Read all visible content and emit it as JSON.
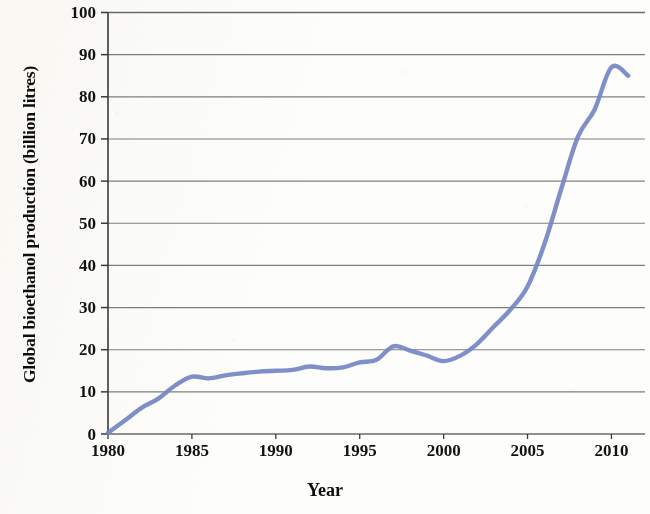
{
  "chart_data": {
    "type": "line",
    "title": "",
    "xlabel": "Year",
    "ylabel": "Global bioethanol production (billion litres)",
    "xlim": [
      1980,
      2012
    ],
    "ylim": [
      0,
      100
    ],
    "xticks": [
      "1980",
      "1985",
      "1990",
      "1995",
      "2000",
      "2005",
      "2010"
    ],
    "xtick_values": [
      1980,
      1985,
      1990,
      1995,
      2000,
      2005,
      2010
    ],
    "yticks": [
      "0",
      "10",
      "20",
      "30",
      "40",
      "50",
      "60",
      "70",
      "80",
      "90",
      "100"
    ],
    "ytick_values": [
      0,
      10,
      20,
      30,
      40,
      50,
      60,
      70,
      80,
      90,
      100
    ],
    "grid": "horizontal",
    "legend": "none",
    "series": [
      {
        "name": "Global bioethanol production",
        "color": "#7485c4",
        "x": [
          1980,
          1981,
          1982,
          1983,
          1984,
          1985,
          1986,
          1987,
          1988,
          1989,
          1990,
          1991,
          1992,
          1993,
          1994,
          1995,
          1996,
          1997,
          1998,
          1999,
          2000,
          2001,
          2002,
          2003,
          2004,
          2005,
          2006,
          2007,
          2008,
          2009,
          2010,
          2011
        ],
        "values": [
          0.3,
          3.2,
          6.2,
          8.4,
          11.5,
          13.6,
          13.2,
          13.9,
          14.4,
          14.8,
          15.0,
          15.2,
          16.0,
          15.6,
          15.8,
          17.0,
          17.6,
          20.8,
          19.8,
          18.6,
          17.3,
          18.6,
          21.4,
          25.5,
          29.6,
          35.0,
          45.0,
          58.0,
          70.5,
          77.0,
          87.0,
          85.0
        ]
      }
    ]
  },
  "axes": {
    "y_axis_label": "Global bioethanol production (billion litres)",
    "x_axis_label": "Year",
    "y_tick_labels": [
      "100",
      "90",
      "80",
      "70",
      "60",
      "50",
      "40",
      "30",
      "20",
      "10",
      "0"
    ],
    "x_tick_labels": [
      "1980",
      "1985",
      "1990",
      "1995",
      "2000",
      "2005",
      "2010"
    ]
  },
  "style": {
    "line_color": "#7485c4",
    "grid_color": "#5c5c5c",
    "axis_color": "#3a3a3a",
    "text_color": "#121212",
    "background": "#fdfdfb"
  }
}
